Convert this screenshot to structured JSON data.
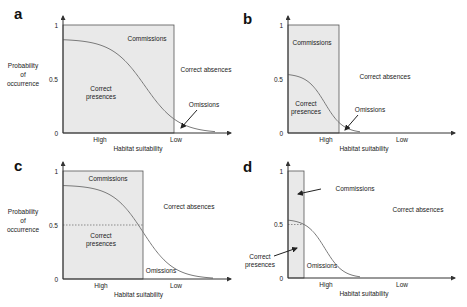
{
  "figure": {
    "colors": {
      "shaded_box": "#e9e9e9",
      "curve": "#7a7a7a",
      "axis": "#333333",
      "text": "#222222"
    },
    "common": {
      "y_axis_label_lines": [
        "Probability",
        "of",
        "occurrence"
      ],
      "x_axis_label": "Habitat suitability",
      "x_high": "High",
      "x_low": "Low",
      "y_ticks": [
        "1",
        "0.5",
        "0"
      ]
    },
    "panels": [
      {
        "letter": "a",
        "origin": [
          63,
          133
        ],
        "width": 168,
        "height": 108,
        "box_right": 174,
        "show_y_label": true,
        "dashed_half": false,
        "curve_start": 0.87,
        "curve_mid_x": 145,
        "curve_k": 0.06,
        "curve_end_x": 215,
        "labels": {
          "commissions": {
            "text": "Commissions",
            "x": 147,
            "y": 41
          },
          "correct_presences": {
            "lines": [
              "Correct",
              "presences"
            ],
            "x": 101,
            "y": 91
          },
          "correct_absences": {
            "text": "Correct absences",
            "x": 206,
            "y": 72
          },
          "omissions": {
            "text": "Omissions",
            "x": 204,
            "y": 107
          }
        },
        "omission_arrow": [
          [
            197,
            110
          ],
          [
            181,
            128
          ]
        ],
        "x_high_pos": 100,
        "x_low_pos": 176
      },
      {
        "letter": "b",
        "origin": [
          288,
          133
        ],
        "width": 167,
        "height": 108,
        "box_right": 339,
        "show_y_label": false,
        "dashed_half": false,
        "curve_start": 0.55,
        "curve_mid_x": 325,
        "curve_k": 0.11,
        "curve_end_x": 360,
        "labels": {
          "commissions": {
            "text": "Commissions",
            "x": 312,
            "y": 45
          },
          "correct_presences": {
            "lines": [
              "Correct",
              "presences"
            ],
            "x": 306,
            "y": 106
          },
          "correct_absences": {
            "text": "Correct absences",
            "x": 385,
            "y": 79
          },
          "omissions": {
            "text": "Omissions",
            "x": 370,
            "y": 112
          }
        },
        "omission_arrow": [
          [
            358,
            115
          ],
          [
            345,
            130
          ]
        ],
        "x_high_pos": 326,
        "x_low_pos": 402
      },
      {
        "letter": "c",
        "origin": [
          63,
          279
        ],
        "width": 168,
        "height": 108,
        "box_right": 143,
        "show_y_label": true,
        "dashed_half": true,
        "curve_start": 0.87,
        "curve_mid_x": 143,
        "curve_k": 0.065,
        "curve_end_x": 213,
        "labels": {
          "commissions": {
            "text": "Commissions",
            "x": 108,
            "y": 181
          },
          "correct_presences": {
            "lines": [
              "Correct",
              "presences"
            ],
            "x": 101,
            "y": 238
          },
          "correct_absences": {
            "text": "Correct absences",
            "x": 189,
            "y": 209
          },
          "omissions": {
            "text": "Omissions",
            "x": 161,
            "y": 273
          }
        },
        "omission_arrow": null,
        "x_high_pos": 101,
        "x_low_pos": 176
      },
      {
        "letter": "d",
        "origin": [
          288,
          278
        ],
        "width": 167,
        "height": 107,
        "box_right": 304,
        "show_y_label": false,
        "dashed_half": false,
        "dashed_short": true,
        "curve_start": 0.55,
        "curve_mid_x": 325,
        "curve_k": 0.11,
        "curve_end_x": 360,
        "labels": {
          "commissions": {
            "text": "Commissions",
            "x": 355,
            "y": 191
          },
          "correct_presences": {
            "lines": [
              "Correct",
              "presences"
            ],
            "x": 260,
            "y": 259
          },
          "correct_absences": {
            "text": "Correct absences",
            "x": 418,
            "y": 212
          },
          "omissions": {
            "text": "Omissions",
            "x": 322,
            "y": 268
          }
        },
        "commission_arrow": [
          [
            321,
            189
          ],
          [
            298,
            194
          ]
        ],
        "presence_arrow": [
          [
            274,
            256
          ],
          [
            297,
            248
          ]
        ],
        "omission_arrow": null,
        "x_high_pos": 326,
        "x_low_pos": 402
      }
    ]
  }
}
